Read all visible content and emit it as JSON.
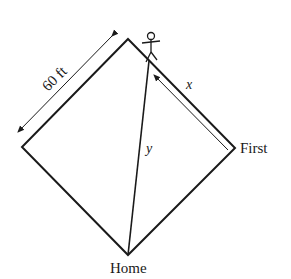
{
  "diagram": {
    "side_length_label": "60 ft",
    "distance_label_x": "x",
    "distance_label_y": "y",
    "base_first_label": "First",
    "base_home_label": "Home",
    "colors": {
      "stroke": "#1a1a1a",
      "background": "#ffffff"
    },
    "vertices": {
      "top": [
        128,
        39
      ],
      "right": [
        235,
        148
      ],
      "bottom": [
        128,
        255
      ],
      "left": [
        22,
        147
      ]
    },
    "runner_position": [
      148,
      60
    ]
  }
}
